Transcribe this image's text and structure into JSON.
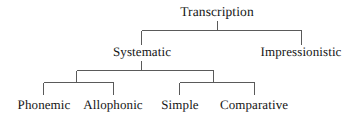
{
  "diagram": {
    "type": "hierarchical-tree",
    "title": "Transcription",
    "background_color": "#ffffff",
    "line_color": "#5a5a5a",
    "text_color": "#161616",
    "line_width": 1,
    "levels": 3,
    "nodes": [
      {
        "id": "transcription",
        "label": "Transcription",
        "level": 0,
        "parent": null,
        "center_x": 217,
        "baseline_y": 17
      },
      {
        "id": "systematic",
        "label": "Systematic",
        "level": 1,
        "parent": "transcription",
        "center_x": 142,
        "baseline_y": 57
      },
      {
        "id": "impressionistic",
        "label": "Impressionistic",
        "level": 1,
        "parent": "transcription",
        "center_x": 301,
        "baseline_y": 57
      },
      {
        "id": "phonemic",
        "label": "Phonemic",
        "level": 2,
        "parent": "systematic",
        "center_x": 44,
        "baseline_y": 110
      },
      {
        "id": "allophonic",
        "label": "Allophonic",
        "level": 2,
        "parent": "systematic",
        "center_x": 113,
        "baseline_y": 110
      },
      {
        "id": "simple",
        "label": "Simple",
        "level": 2,
        "parent": "systematic",
        "center_x": 180,
        "baseline_y": 110
      },
      {
        "id": "comparative",
        "label": "Comparative",
        "level": 2,
        "parent": "systematic",
        "center_x": 254,
        "baseline_y": 110
      }
    ],
    "connectors": {
      "root_stem": {
        "x": 217,
        "y1": 21,
        "y2": 30
      },
      "level1_bar": {
        "y": 30,
        "x1": 142,
        "x2": 301
      },
      "level1_drops": [
        {
          "x": 142,
          "y1": 30,
          "y2": 45
        },
        {
          "x": 301,
          "y1": 30,
          "y2": 45
        }
      ],
      "systematic_stem": {
        "x": 142,
        "y1": 61,
        "y2": 70
      },
      "level2_bar": {
        "y": 70,
        "x1": 77,
        "x2": 213
      },
      "level2_drops": [
        {
          "x": 77,
          "y1": 70,
          "y2": 82
        },
        {
          "x": 213,
          "y1": 70,
          "y2": 82
        }
      ],
      "left_group_bar": {
        "y": 82,
        "x1": 44,
        "x2": 113
      },
      "left_group_drops": [
        {
          "x": 44,
          "y1": 82,
          "y2": 95
        },
        {
          "x": 113,
          "y1": 82,
          "y2": 95
        }
      ],
      "right_group_bar": {
        "y": 82,
        "x1": 180,
        "x2": 254
      },
      "right_group_drops": [
        {
          "x": 180,
          "y1": 82,
          "y2": 95
        },
        {
          "x": 254,
          "y1": 82,
          "y2": 95
        }
      ]
    }
  }
}
